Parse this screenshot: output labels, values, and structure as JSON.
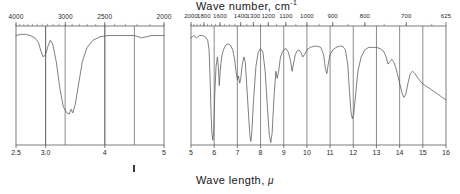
{
  "figure": {
    "top_axis_title": "Wave number, cm",
    "top_axis_title_sup": "-1",
    "bottom_axis_title": "Wave length, ",
    "bottom_axis_title_unit": "μ",
    "background": "#ffffff",
    "trace_color": "#555555",
    "frame_color": "#5a5a5a"
  },
  "left_panel": {
    "name": "ir-spectrum-left-panel",
    "top_ticks": [
      "4000",
      "3000",
      "2500",
      "2000"
    ],
    "top_tick_values": [
      4000,
      3000,
      2500,
      2000
    ],
    "bottom_ticks": [
      "2.5",
      "3.0",
      "4",
      "5"
    ],
    "bottom_tick_values": [
      2.5,
      3.0,
      4.0,
      5.0
    ],
    "gridlines_wavelength": [
      2.5,
      3.0,
      3.33,
      4.0,
      4.5,
      5.0
    ]
  },
  "right_panel": {
    "name": "ir-spectrum-right-panel",
    "top_ticks": [
      "2000",
      "1800",
      "1600",
      "1400",
      "1300",
      "1200",
      "1100",
      "1000",
      "900",
      "800",
      "700",
      "625"
    ],
    "top_tick_values": [
      2000,
      1800,
      1600,
      1400,
      1300,
      1200,
      1100,
      1000,
      900,
      800,
      700,
      625
    ],
    "bottom_ticks": [
      "5",
      "6",
      "7",
      "8",
      "9",
      "10",
      "11",
      "12",
      "13",
      "14",
      "15",
      "16"
    ],
    "bottom_tick_values": [
      5,
      6,
      7,
      8,
      9,
      10,
      11,
      12,
      13,
      14,
      15,
      16
    ]
  },
  "chart_data": {
    "type": "line",
    "xlabel": "Wave length, μ",
    "xlabel_secondary": "Wave number, cm-1",
    "ylabel": "Transmittance",
    "grid": true,
    "legend": "none",
    "panels": [
      {
        "name": "left",
        "xlim": [
          2.5,
          5.0
        ],
        "ylim": [
          0,
          100
        ],
        "x_unit": "micron",
        "points": [
          [
            2.5,
            92
          ],
          [
            2.58,
            93
          ],
          [
            2.66,
            93
          ],
          [
            2.74,
            92
          ],
          [
            2.82,
            90
          ],
          [
            2.88,
            86
          ],
          [
            2.92,
            79
          ],
          [
            2.96,
            74
          ],
          [
            3.0,
            76
          ],
          [
            3.04,
            83
          ],
          [
            3.08,
            88
          ],
          [
            3.12,
            85
          ],
          [
            3.18,
            70
          ],
          [
            3.24,
            48
          ],
          [
            3.3,
            32
          ],
          [
            3.36,
            27
          ],
          [
            3.4,
            26
          ],
          [
            3.43,
            30
          ],
          [
            3.46,
            27
          ],
          [
            3.5,
            34
          ],
          [
            3.56,
            52
          ],
          [
            3.62,
            70
          ],
          [
            3.7,
            82
          ],
          [
            3.8,
            88
          ],
          [
            3.92,
            91
          ],
          [
            4.05,
            92
          ],
          [
            4.2,
            92
          ],
          [
            4.35,
            92
          ],
          [
            4.5,
            92
          ],
          [
            4.62,
            90
          ],
          [
            4.7,
            91
          ],
          [
            4.8,
            92
          ],
          [
            4.9,
            92
          ],
          [
            5.0,
            92
          ]
        ]
      },
      {
        "name": "right",
        "xlim": [
          5.0,
          16.0
        ],
        "ylim": [
          0,
          100
        ],
        "x_unit": "micron",
        "points": [
          [
            5.0,
            90
          ],
          [
            5.12,
            92
          ],
          [
            5.24,
            90
          ],
          [
            5.36,
            92
          ],
          [
            5.5,
            92
          ],
          [
            5.62,
            91
          ],
          [
            5.72,
            88
          ],
          [
            5.78,
            80
          ],
          [
            5.82,
            58
          ],
          [
            5.86,
            30
          ],
          [
            5.9,
            10
          ],
          [
            5.94,
            4
          ],
          [
            5.98,
            12
          ],
          [
            6.02,
            40
          ],
          [
            6.08,
            66
          ],
          [
            6.14,
            74
          ],
          [
            6.18,
            66
          ],
          [
            6.22,
            50
          ],
          [
            6.26,
            62
          ],
          [
            6.32,
            74
          ],
          [
            6.4,
            80
          ],
          [
            6.5,
            84
          ],
          [
            6.6,
            85
          ],
          [
            6.7,
            84
          ],
          [
            6.8,
            80
          ],
          [
            6.88,
            72
          ],
          [
            6.94,
            62
          ],
          [
            7.0,
            55
          ],
          [
            7.05,
            58
          ],
          [
            7.1,
            52
          ],
          [
            7.14,
            55
          ],
          [
            7.2,
            66
          ],
          [
            7.28,
            74
          ],
          [
            7.34,
            70
          ],
          [
            7.4,
            52
          ],
          [
            7.48,
            26
          ],
          [
            7.54,
            8
          ],
          [
            7.58,
            3
          ],
          [
            7.62,
            10
          ],
          [
            7.7,
            38
          ],
          [
            7.8,
            66
          ],
          [
            7.9,
            78
          ],
          [
            8.0,
            81
          ],
          [
            8.1,
            78
          ],
          [
            8.2,
            62
          ],
          [
            8.3,
            30
          ],
          [
            8.38,
            8
          ],
          [
            8.44,
            2
          ],
          [
            8.5,
            10
          ],
          [
            8.58,
            40
          ],
          [
            8.66,
            62
          ],
          [
            8.72,
            56
          ],
          [
            8.78,
            62
          ],
          [
            8.86,
            74
          ],
          [
            8.94,
            78
          ],
          [
            9.0,
            80
          ],
          [
            9.1,
            81
          ],
          [
            9.2,
            78
          ],
          [
            9.3,
            70
          ],
          [
            9.36,
            62
          ],
          [
            9.42,
            68
          ],
          [
            9.5,
            76
          ],
          [
            9.58,
            79
          ],
          [
            9.66,
            80
          ],
          [
            9.74,
            78
          ],
          [
            9.82,
            74
          ],
          [
            9.9,
            76
          ],
          [
            10.0,
            80
          ],
          [
            10.14,
            82
          ],
          [
            10.3,
            83
          ],
          [
            10.46,
            83
          ],
          [
            10.6,
            82
          ],
          [
            10.72,
            76
          ],
          [
            10.8,
            64
          ],
          [
            10.86,
            60
          ],
          [
            10.92,
            68
          ],
          [
            11.0,
            76
          ],
          [
            11.12,
            80
          ],
          [
            11.26,
            82
          ],
          [
            11.4,
            83
          ],
          [
            11.54,
            83
          ],
          [
            11.66,
            80
          ],
          [
            11.76,
            68
          ],
          [
            11.84,
            44
          ],
          [
            11.9,
            28
          ],
          [
            11.96,
            22
          ],
          [
            12.02,
            26
          ],
          [
            12.1,
            42
          ],
          [
            12.2,
            62
          ],
          [
            12.34,
            74
          ],
          [
            12.5,
            80
          ],
          [
            12.66,
            82
          ],
          [
            12.82,
            82
          ],
          [
            13.0,
            82
          ],
          [
            13.16,
            81
          ],
          [
            13.3,
            79
          ],
          [
            13.42,
            74
          ],
          [
            13.5,
            68
          ],
          [
            13.58,
            70
          ],
          [
            13.66,
            72
          ],
          [
            13.74,
            70
          ],
          [
            13.82,
            66
          ],
          [
            13.9,
            60
          ],
          [
            14.0,
            52
          ],
          [
            14.1,
            44
          ],
          [
            14.18,
            40
          ],
          [
            14.26,
            42
          ],
          [
            14.36,
            52
          ],
          [
            14.46,
            60
          ],
          [
            14.56,
            62
          ],
          [
            14.66,
            60
          ],
          [
            14.8,
            56
          ],
          [
            14.96,
            52
          ],
          [
            15.1,
            50
          ],
          [
            15.26,
            48
          ],
          [
            15.4,
            46
          ],
          [
            15.56,
            44
          ],
          [
            15.7,
            42
          ],
          [
            15.84,
            40
          ],
          [
            16.0,
            38
          ]
        ]
      }
    ]
  }
}
